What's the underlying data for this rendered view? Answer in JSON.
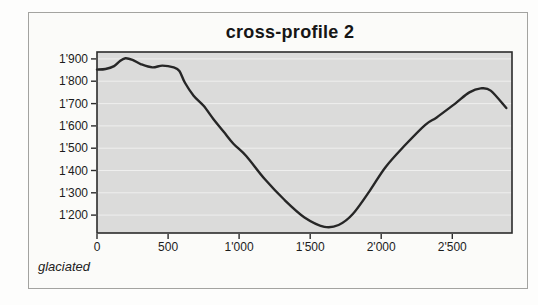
{
  "figure": {
    "title": "cross-profile 2",
    "caption": "glaciated"
  },
  "chart_data": {
    "type": "line",
    "title": "cross-profile 2",
    "xlabel": "",
    "ylabel": "",
    "annotation": "glaciated",
    "xlim": [
      0,
      2920
    ],
    "ylim": [
      1120,
      1931
    ],
    "grid": "horizontal",
    "legend": "none",
    "x_ticks": {
      "values": [
        0,
        500,
        1000,
        1500,
        2000,
        2500
      ],
      "labels": [
        "0",
        "500",
        "1'000",
        "1'500",
        "2'000",
        "2'500"
      ]
    },
    "y_ticks": {
      "values": [
        1900,
        1800,
        1700,
        1600,
        1500,
        1400,
        1300,
        1200
      ],
      "labels": [
        "1'900",
        "1'800",
        "1'700",
        "1'600",
        "1'500",
        "1'400",
        "1'300",
        "1'200"
      ]
    },
    "series": [
      {
        "name": "elevation-profile",
        "points": [
          [
            0,
            1852
          ],
          [
            60,
            1855
          ],
          [
            120,
            1868
          ],
          [
            160,
            1890
          ],
          [
            200,
            1903
          ],
          [
            250,
            1896
          ],
          [
            310,
            1876
          ],
          [
            390,
            1862
          ],
          [
            460,
            1870
          ],
          [
            540,
            1862
          ],
          [
            580,
            1846
          ],
          [
            620,
            1792
          ],
          [
            680,
            1735
          ],
          [
            750,
            1690
          ],
          [
            820,
            1630
          ],
          [
            890,
            1575
          ],
          [
            960,
            1520
          ],
          [
            1050,
            1465
          ],
          [
            1180,
            1362
          ],
          [
            1320,
            1268
          ],
          [
            1460,
            1190
          ],
          [
            1600,
            1148
          ],
          [
            1700,
            1156
          ],
          [
            1800,
            1205
          ],
          [
            1920,
            1310
          ],
          [
            2030,
            1415
          ],
          [
            2170,
            1515
          ],
          [
            2310,
            1605
          ],
          [
            2390,
            1638
          ],
          [
            2520,
            1700
          ],
          [
            2620,
            1750
          ],
          [
            2700,
            1768
          ],
          [
            2770,
            1758
          ],
          [
            2880,
            1680
          ]
        ]
      }
    ],
    "colors": {
      "line": "#262626",
      "plot_bg": "#dbdbda",
      "grid": "#efefee",
      "axis": "#2b2b2b",
      "frame_border": "#a3a3a0",
      "frame_bg": "#fbfbf9"
    }
  }
}
